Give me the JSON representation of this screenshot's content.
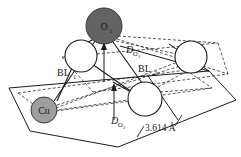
{
  "figure": {
    "background_color": "#ffffff",
    "width": 241,
    "height": 157
  },
  "colors": {
    "oxygen_adatom_fill": "#636363",
    "copper_fill": "#9e9e9e",
    "open_circle_fill": "#ffffff",
    "stroke": "#1a1a1a",
    "dashed_stroke": "#2b2b2b",
    "label_color": "#1a1a1a"
  },
  "atoms": [
    {
      "id": "oxygen-adatom",
      "label": "O",
      "sublabel": "1",
      "type": "filled-dark",
      "cx": 104,
      "cy": 26,
      "r": 18,
      "fill": "#636363",
      "label_color": "#1a1a1a"
    },
    {
      "id": "copper-atom",
      "label": "Cu",
      "sublabel": "",
      "type": "filled-mid",
      "cx": 44,
      "cy": 110,
      "r": 13,
      "fill": "#9e9e9e",
      "label_color": "#1a1a1a"
    },
    {
      "id": "surface-atom-left",
      "label": "",
      "sublabel": "",
      "type": "open",
      "cx": 81,
      "cy": 56,
      "r": 16,
      "fill": "#ffffff",
      "label_color": "#1a1a1a"
    },
    {
      "id": "surface-atom-right",
      "label": "",
      "sublabel": "",
      "type": "open",
      "cx": 191,
      "cy": 57,
      "r": 16,
      "fill": "#ffffff",
      "label_color": "#1a1a1a"
    },
    {
      "id": "surface-atom-front",
      "label": "",
      "sublabel": "",
      "type": "open",
      "cx": 145,
      "cy": 99,
      "r": 17,
      "fill": "#ffffff",
      "label_color": "#1a1a1a"
    }
  ],
  "labels": {
    "bond_length_1": {
      "base": "BL",
      "sub": "1",
      "x": 57,
      "y": 76
    },
    "bond_length_2": {
      "base": "BL",
      "sub": "2",
      "x": 138,
      "y": 72
    },
    "depth_o1": {
      "base": "D",
      "sub": "O",
      "subsub": "1",
      "x": 126,
      "y": 53
    },
    "depth_o2": {
      "base": "D",
      "sub": "O",
      "subsub": "2",
      "x": 111,
      "y": 124
    },
    "lattice_distance": {
      "text": "3.614 Å",
      "x": 145,
      "y": 131
    }
  },
  "measurements": {
    "lattice_constant_value": "3.614",
    "lattice_constant_unit": "Å",
    "bond_labels": [
      "BL1",
      "BL2"
    ],
    "depth_labels": [
      "DO1",
      "DO2"
    ]
  },
  "geometry": {
    "slab_top_plane": "72,50 210,38 232,80 96,94",
    "slab_base_plane": "33,84 198,66 230,116 65,140",
    "slab_far_edge": "9,88 148,76 169,118 30,131"
  }
}
